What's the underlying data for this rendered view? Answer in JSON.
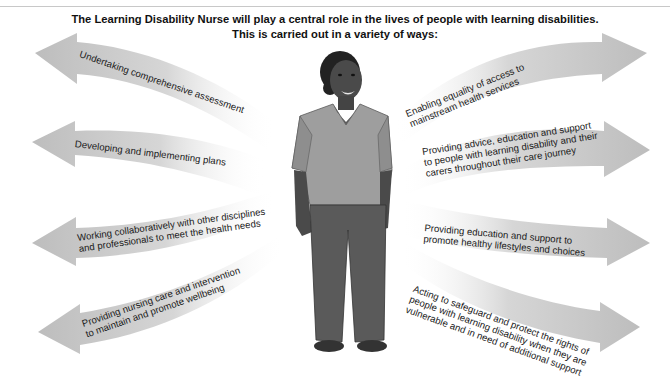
{
  "title": {
    "line1": "The Learning Disability Nurse will play a central role in the lives of people with learning disabilities.",
    "line2": "This is carried out in a variety of ways:"
  },
  "figure": {
    "label": "Learning Disability Nurse illustration (woman in grey blouse and trousers)"
  },
  "left_arrows": [
    {
      "lines": [
        "Undertaking comprehensive assessment"
      ]
    },
    {
      "lines": [
        "Developing and implementing plans"
      ]
    },
    {
      "lines": [
        "Working collaboratively with other disciplines",
        "and professionals to meet the health needs"
      ]
    },
    {
      "lines": [
        "Providing nursing care and intervention",
        "to maintain and promote wellbeing"
      ]
    }
  ],
  "right_arrows": [
    {
      "lines": [
        "Enabling equality of access to",
        "mainstream health services"
      ]
    },
    {
      "lines": [
        "Providing advice, education and support",
        "to people with learning disability and their",
        "carers throughout their care journey"
      ]
    },
    {
      "lines": [
        "Providing education and support to",
        "promote healthy lifestyles and choices"
      ]
    },
    {
      "lines": [
        "Acting to safeguard and protect the rights of",
        "people with learning disability when they are",
        "vulnerable and in need of additional support"
      ]
    }
  ],
  "colors": {
    "arrow": "#c4c4c4",
    "arrow_fade": "#ffffff",
    "skin": "#4a4a4a",
    "blouse": "#9e9e9e",
    "trousers": "#5a5a5a",
    "shoes": "#3a3a3a"
  }
}
